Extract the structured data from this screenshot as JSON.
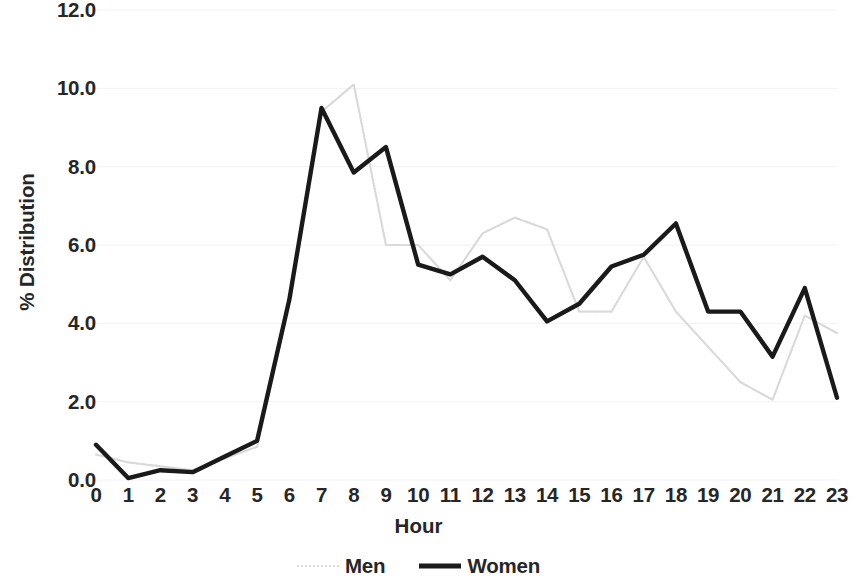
{
  "chart_data": {
    "type": "line",
    "title": "",
    "xlabel": "Hour",
    "ylabel": "% Distribution",
    "x": [
      0,
      1,
      2,
      3,
      4,
      5,
      6,
      7,
      8,
      9,
      10,
      11,
      12,
      13,
      14,
      15,
      16,
      17,
      18,
      19,
      20,
      21,
      22,
      23
    ],
    "categories": [
      "0",
      "1",
      "2",
      "3",
      "4",
      "5",
      "6",
      "7",
      "8",
      "9",
      "10",
      "11",
      "12",
      "13",
      "14",
      "15",
      "16",
      "17",
      "18",
      "19",
      "20",
      "21",
      "22",
      "23"
    ],
    "series": [
      {
        "name": "Men",
        "color": "#d9d9d9",
        "style": "dotted",
        "values": [
          0.65,
          0.45,
          0.35,
          0.25,
          0.55,
          0.85,
          4.55,
          9.4,
          10.1,
          6.0,
          6.0,
          5.1,
          6.3,
          6.7,
          6.4,
          4.3,
          4.3,
          5.7,
          4.3,
          3.4,
          2.5,
          2.05,
          4.2,
          3.75
        ]
      },
      {
        "name": "Women",
        "color": "#1a1a1a",
        "style": "solid",
        "values": [
          0.9,
          0.05,
          0.25,
          0.2,
          0.6,
          1.0,
          4.6,
          9.5,
          7.85,
          8.5,
          5.5,
          5.25,
          5.7,
          5.1,
          4.05,
          4.5,
          5.45,
          5.75,
          6.55,
          4.3,
          4.3,
          3.15,
          4.9,
          2.1
        ]
      }
    ],
    "ylim": [
      0,
      12
    ],
    "ytick_values": [
      0,
      2,
      4,
      6,
      8,
      10,
      12
    ],
    "ytick_labels": [
      "0.0",
      "2.0",
      "4.0",
      "6.0",
      "8.0",
      "10.0",
      "12.0"
    ],
    "xlim": [
      0,
      23
    ],
    "grid": true,
    "grid_axis": "y",
    "grid_color": "#f2f2f2",
    "legend_position": "bottom"
  },
  "legend": {
    "items": [
      {
        "label": "Men",
        "swatch": "dotted-light-gray-line"
      },
      {
        "label": "Women",
        "swatch": "solid-black-line"
      }
    ]
  }
}
